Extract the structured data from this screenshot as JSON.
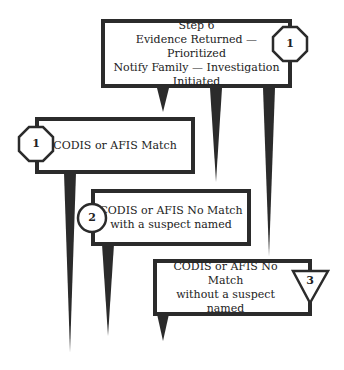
{
  "diagram": {
    "step_box": {
      "lines": [
        "Step 6",
        "Evidence Returned — Prioritized",
        "Notify Family — Investigation Initiated"
      ],
      "badge": "1",
      "badge_shape": "octagon"
    },
    "outcomes": [
      {
        "lines": [
          "CODIS or AFIS Match"
        ],
        "badge": "1",
        "badge_shape": "octagon"
      },
      {
        "lines": [
          "CODIS or AFIS No Match",
          "with a suspect named"
        ],
        "badge": "2",
        "badge_shape": "circle"
      },
      {
        "lines": [
          "CODIS or AFIS No Match",
          "without a suspect named"
        ],
        "badge": "3",
        "badge_shape": "inverted-triangle"
      }
    ],
    "colors": {
      "stroke": "#2b2b2b",
      "fill": "#ffffff",
      "text": "#222222"
    }
  }
}
